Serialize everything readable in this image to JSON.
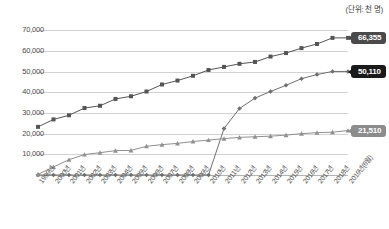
{
  "chart_data": {
    "type": "line",
    "title": "",
    "subtitle": "",
    "unit_caption": "(단위: 천 명)",
    "xlabel": "",
    "ylabel": "",
    "grid": true,
    "legend_position": "none",
    "ylim": [
      0,
      75000
    ],
    "yticks": [
      "10,000",
      "20,000",
      "30,000",
      "40,000",
      "50,000",
      "60,000",
      "70,000"
    ],
    "ytick_values": [
      10000,
      20000,
      30000,
      40000,
      50000,
      60000,
      70000
    ],
    "categories": [
      "1999년",
      "2000년",
      "2001년",
      "2002년",
      "2003년",
      "2004년",
      "2005년",
      "2006년",
      "2007년",
      "2008년",
      "2009년",
      "2010년",
      "2011년",
      "2012년",
      "2013년",
      "2014년",
      "2015년",
      "2016년",
      "2017년",
      "2018년",
      "2019년(6월)"
    ],
    "series": [
      {
        "name": "series-upper",
        "marker": "square",
        "color": "#555555",
        "end_label": "66,355",
        "values": [
          23300,
          26900,
          28900,
          32400,
          33500,
          36800,
          38100,
          40400,
          43800,
          45700,
          48000,
          50800,
          52300,
          53800,
          54700,
          57300,
          59000,
          61400,
          63400,
          66355,
          66355
        ]
      },
      {
        "name": "series-middle",
        "marker": "diamond",
        "color": "#6e6e6e",
        "end_label": "50,110",
        "values": [
          0,
          0,
          0,
          0,
          0,
          0,
          0,
          0,
          0,
          0,
          0,
          0,
          22500,
          32200,
          37200,
          40400,
          43400,
          46600,
          48600,
          50110,
          50110
        ]
      },
      {
        "name": "series-lower",
        "marker": "triangle",
        "color": "#909090",
        "end_label": "21,510",
        "values": [
          300,
          3900,
          7400,
          9900,
          10800,
          11800,
          11900,
          13900,
          14700,
          15300,
          16200,
          16900,
          17600,
          18200,
          18500,
          18800,
          19300,
          20000,
          20500,
          20700,
          21510
        ]
      }
    ]
  },
  "callouts": [
    {
      "name": "callout-upper",
      "text": "66,355"
    },
    {
      "name": "callout-middle",
      "text": "50,110"
    },
    {
      "name": "callout-lower",
      "text": "21,510"
    }
  ]
}
